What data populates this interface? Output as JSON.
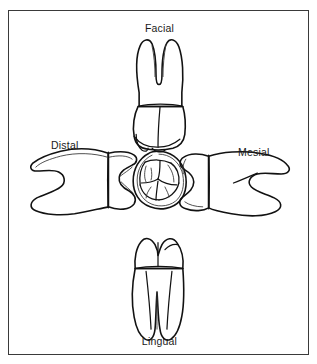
{
  "figure": {
    "kind": "dental-anatomy-line-drawing",
    "border_color": "#3a3a3a",
    "background_color": "#ffffff",
    "line_color": "#121212"
  },
  "labels": {
    "facial": "Facial",
    "lingual": "Lingual",
    "distal": "Distal",
    "mesial": "Mesial"
  },
  "views": [
    {
      "id": "facial",
      "label": "Facial",
      "position": "top",
      "description": "crown below, two roots above"
    },
    {
      "id": "distal",
      "label": "Distal",
      "position": "left",
      "description": "crown right, roots left"
    },
    {
      "id": "occlusal",
      "label": "",
      "position": "center",
      "description": "chewing surface with cusps and grooves"
    },
    {
      "id": "mesial",
      "label": "Mesial",
      "position": "right",
      "description": "crown left, roots right"
    },
    {
      "id": "lingual",
      "label": "Lingual",
      "position": "bottom",
      "description": "crown above, two roots below"
    }
  ]
}
